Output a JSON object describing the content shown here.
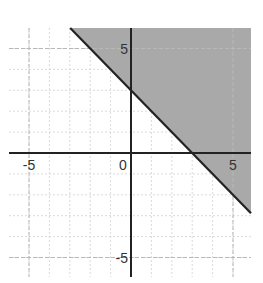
{
  "chart_data": {
    "type": "inequality-graph",
    "title": "",
    "xlabel": "",
    "ylabel": "",
    "xlim": [
      -6,
      6
    ],
    "ylim": [
      -6,
      6
    ],
    "grid": true,
    "grid_step": 1,
    "x_tick_labels": [
      {
        "value": -5,
        "label": "-5"
      },
      {
        "value": 0,
        "label": "0"
      },
      {
        "value": 5,
        "label": "5"
      }
    ],
    "y_tick_labels": [
      {
        "value": 5,
        "label": "5"
      },
      {
        "value": -5,
        "label": "-5"
      }
    ],
    "boundary_line": {
      "equation": "y = -x + 3",
      "slope": -1,
      "intercept": 3,
      "style": "solid",
      "points": [
        [
          -3,
          6
        ],
        [
          0,
          3
        ],
        [
          3,
          0
        ],
        [
          6,
          -3
        ]
      ]
    },
    "inequality": "y >= -x + 3",
    "shaded_region": "above the line",
    "colors": {
      "shade": "#a9a9a9",
      "line": "#222222",
      "axis": "#222222",
      "grid": "#d0d0d0",
      "major_grid": "#b8b8b8"
    }
  }
}
